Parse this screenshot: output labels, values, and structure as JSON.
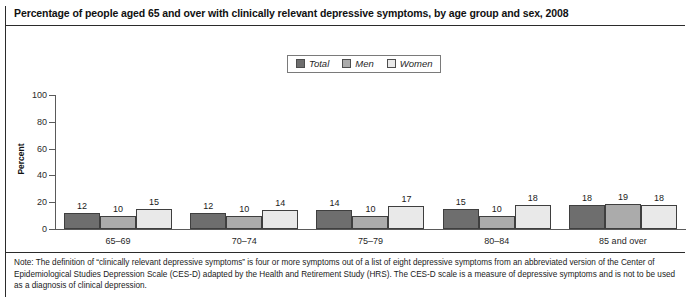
{
  "figure": {
    "title": "Percentage of people aged 65 and over with clinically relevant depressive symptoms, by age group and sex, 2008",
    "note": "Note: The definition of “clinically relevant depressive symptoms” is four or more symptoms out of a list of eight depressive symptoms from an abbreviated version of the Center of Epidemiological Studies Depression Scale (CES-D) adapted by the Health and Retirement Study (HRS). The CES-D scale is a measure of depressive symptoms and is not to be used as a diagnosis of clinical depression."
  },
  "chart_data": {
    "type": "bar",
    "title": "Percentage of people aged 65 and over with clinically relevant depressive symptoms, by age group and sex, 2008",
    "xlabel": "",
    "ylabel": "Percent",
    "ylim": [
      0,
      100
    ],
    "yticks": [
      0,
      20,
      40,
      60,
      80,
      100
    ],
    "grid": false,
    "legend_position": "top-center",
    "categories": [
      "65–69",
      "70–74",
      "75–79",
      "80–84",
      "85 and over"
    ],
    "series": [
      {
        "name": "Total",
        "color": "#6e6e6e",
        "values": [
          12,
          12,
          14,
          15,
          18
        ]
      },
      {
        "name": "Men",
        "color": "#ababab",
        "values": [
          10,
          10,
          10,
          10,
          19
        ]
      },
      {
        "name": "Women",
        "color": "#e9e9e9",
        "values": [
          15,
          14,
          17,
          18,
          18
        ]
      }
    ]
  },
  "colors": {
    "total": "#6e6e6e",
    "men": "#ababab",
    "women": "#e9e9e9",
    "bar_border": "#3f3f3f",
    "axis": "#5a5a5a",
    "rule": "#2b2b2b"
  }
}
